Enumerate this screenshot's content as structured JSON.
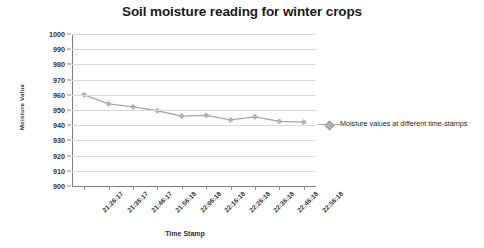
{
  "chart_data": {
    "type": "line",
    "title": "Soil moisture reading for winter crops",
    "xlabel": "Time Stamp",
    "ylabel": "Moisture Value",
    "ylim": [
      900,
      1000
    ],
    "ytick_step": 10,
    "yticks": [
      1000,
      990,
      980,
      970,
      960,
      950,
      940,
      930,
      920,
      910,
      900
    ],
    "grid": true,
    "legend_position": "right",
    "categories": [
      "21:26:17",
      "21:36:17",
      "21:46:17",
      "21:56:18",
      "22:06:18",
      "22:16:18",
      "22:26:18",
      "22:36:18",
      "22:46:18",
      "22:56:18"
    ],
    "series": [
      {
        "name": "Moisture values at different time-stamps",
        "values": [
          960,
          954,
          952,
          949.5,
          946,
          946.5,
          943.5,
          945.5,
          942.5,
          942
        ],
        "color": "#a6a6a6",
        "marker": "diamond"
      }
    ]
  },
  "legend": {
    "entries": [
      {
        "label": "Moisture values at different time-stamps"
      }
    ]
  },
  "colors": {
    "series": "#a6a6a6",
    "marker": "#b3b3b3",
    "gridline": "#d9d9d9",
    "axis": "#7f7f7f",
    "title": "#1a1a1a",
    "text": "#333333",
    "background": "#ffffff"
  }
}
